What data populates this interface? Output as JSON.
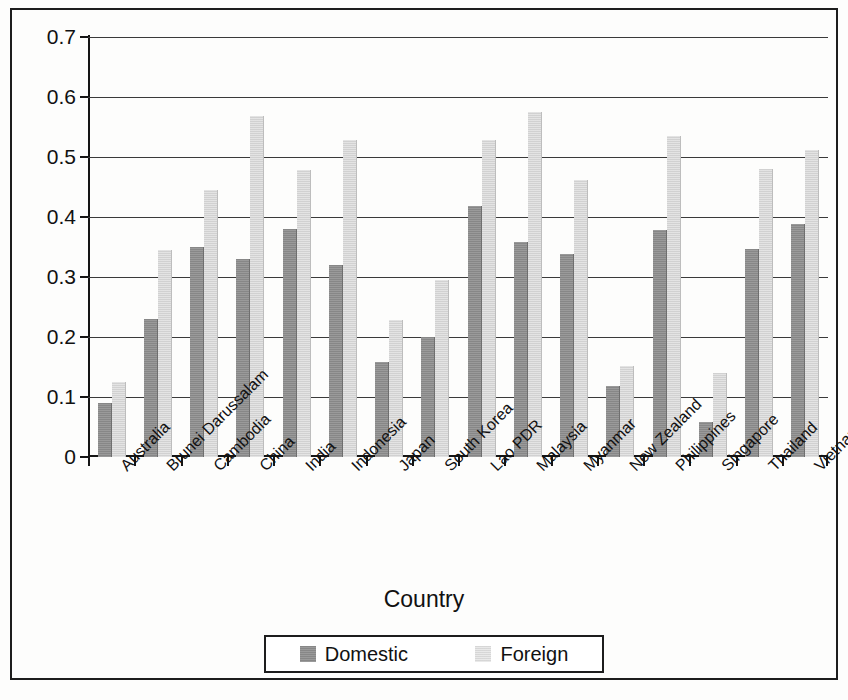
{
  "chart_data": {
    "type": "bar",
    "title": "",
    "xlabel": "Country",
    "ylabel": "",
    "ylim": [
      0,
      0.7
    ],
    "ytick_labels": [
      "0.7",
      "0.6",
      "0.5",
      "0.4",
      "0.3",
      "0.2",
      "0.1",
      "0"
    ],
    "ytick_values": [
      0.7,
      0.6,
      0.5,
      0.4,
      0.3,
      0.2,
      0.1,
      0
    ],
    "grid": true,
    "legend_position": "bottom",
    "categories": [
      "Australia",
      "Brunei Darussalam",
      "Cambodia",
      "China",
      "India",
      "Indonesia",
      "Japan",
      "South Korea",
      "Lao PDR",
      "Malaysia",
      "Myanmar",
      "New Zealand",
      "Philippines",
      "Singapore",
      "Thailand",
      "Vietnam"
    ],
    "series": [
      {
        "name": "Domestic",
        "color": "#8f8f8f",
        "values": [
          0.09,
          0.23,
          0.35,
          0.33,
          0.38,
          0.32,
          0.158,
          0.2,
          0.418,
          0.358,
          0.338,
          0.118,
          0.378,
          0.058,
          0.347,
          0.388
        ]
      },
      {
        "name": "Foreign",
        "color": "#dcdcdc",
        "values": [
          0.125,
          0.345,
          0.445,
          0.568,
          0.478,
          0.528,
          0.228,
          0.295,
          0.528,
          0.575,
          0.462,
          0.152,
          0.535,
          0.14,
          0.48,
          0.512
        ]
      }
    ]
  },
  "legend": {
    "entries": [
      {
        "label": "Domestic"
      },
      {
        "label": "Foreign"
      }
    ]
  }
}
